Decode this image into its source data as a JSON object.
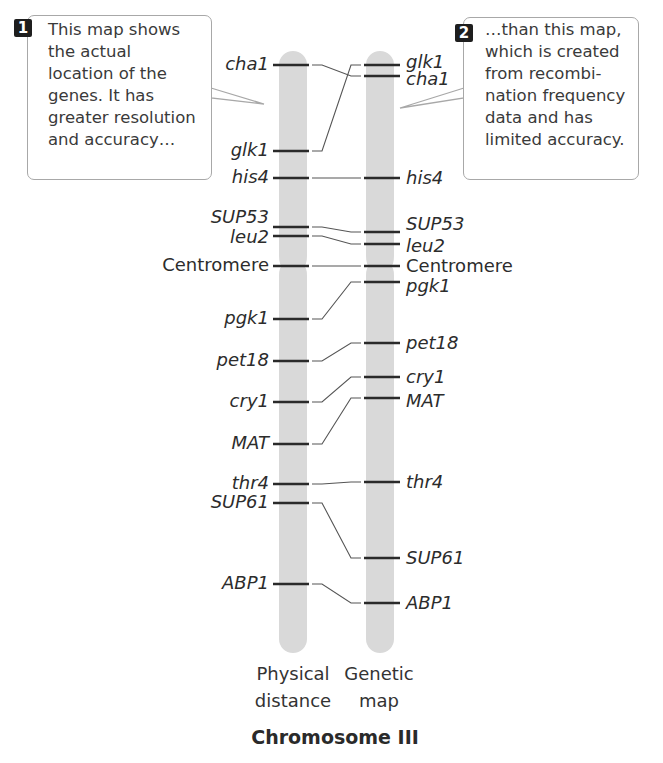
{
  "callouts": [
    {
      "badge": "1",
      "text": "This map shows\nthe actual\nlocation of the\ngenes. It has\ngreater resolution\nand accuracy…"
    },
    {
      "badge": "2",
      "text": "…than this map,\nwhich is created\nfrom recombi-\nnation frequency\ndata and has\nlimited accuracy."
    }
  ],
  "axis_labels": {
    "physical": "Physical\ndistance",
    "genetic": "Genetic\nmap"
  },
  "title": "Chromosome III",
  "colors": {
    "chromosome": "#d9d9d9",
    "band": "#2a2a2a",
    "connector": "#555555",
    "callout_border": "#a8a8a8",
    "badge": "#1e1e1e"
  },
  "chart_data": {
    "type": "diagram",
    "title": "Chromosome III",
    "maps": [
      {
        "name": "Physical distance",
        "genes": [
          {
            "gene": "cha1",
            "y": 65
          },
          {
            "gene": "glk1",
            "y": 151
          },
          {
            "gene": "his4",
            "y": 178
          },
          {
            "gene": "SUP53",
            "y": 227
          },
          {
            "gene": "leu2",
            "y": 236
          },
          {
            "gene": "Centromere",
            "y": 266
          },
          {
            "gene": "pgk1",
            "y": 319
          },
          {
            "gene": "pet18",
            "y": 361
          },
          {
            "gene": "cry1",
            "y": 402
          },
          {
            "gene": "MAT",
            "y": 444
          },
          {
            "gene": "thr4",
            "y": 484
          },
          {
            "gene": "SUP61",
            "y": 503
          },
          {
            "gene": "ABP1",
            "y": 584
          }
        ]
      },
      {
        "name": "Genetic map",
        "genes": [
          {
            "gene": "glk1",
            "y": 65
          },
          {
            "gene": "cha1",
            "y": 76
          },
          {
            "gene": "his4",
            "y": 178
          },
          {
            "gene": "SUP53",
            "y": 232
          },
          {
            "gene": "leu2",
            "y": 244
          },
          {
            "gene": "Centromere",
            "y": 266
          },
          {
            "gene": "pgk1",
            "y": 282
          },
          {
            "gene": "pet18",
            "y": 343
          },
          {
            "gene": "cry1",
            "y": 377
          },
          {
            "gene": "MAT",
            "y": 398
          },
          {
            "gene": "thr4",
            "y": 482
          },
          {
            "gene": "SUP61",
            "y": 558
          },
          {
            "gene": "ABP1",
            "y": 603
          }
        ]
      }
    ]
  }
}
